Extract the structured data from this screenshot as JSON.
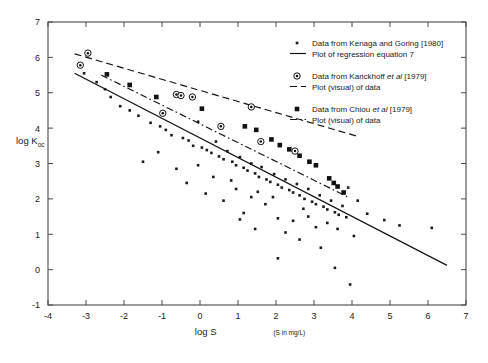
{
  "chart_data": {
    "type": "scatter",
    "title": "",
    "xlabel": "log S",
    "xlabel_units": "(S in mg/L)",
    "ylabel": "log K",
    "ylabel_subscript": "oc",
    "xlim": [
      -4,
      7
    ],
    "ylim": [
      -1,
      7
    ],
    "xticks": [
      -4,
      -3,
      -2,
      -1,
      0,
      1,
      2,
      3,
      4,
      5,
      6,
      7
    ],
    "yticks": [
      -1,
      0,
      1,
      2,
      3,
      4,
      5,
      6,
      7
    ],
    "grid": false,
    "legend_position": "upper-right",
    "series": [
      {
        "name": "kenaga-goring",
        "marker": "small-dot",
        "line": "solid",
        "legend_marker_label": "Data from Kenaga and Goring [1980]",
        "legend_line_label": "Plot of regression equation 7",
        "legend_italic_part": "",
        "line_endpoints": [
          [
            -3.3,
            5.55
          ],
          [
            6.5,
            0.12
          ]
        ],
        "points": [
          [
            -3.05,
            5.55
          ],
          [
            -2.72,
            5.3
          ],
          [
            -2.5,
            5.1
          ],
          [
            -2.35,
            4.88
          ],
          [
            -2.1,
            4.62
          ],
          [
            -1.85,
            4.5
          ],
          [
            -1.62,
            4.35
          ],
          [
            -1.5,
            3.05
          ],
          [
            -1.3,
            4.15
          ],
          [
            -1.05,
            4.05
          ],
          [
            -0.9,
            3.95
          ],
          [
            -0.75,
            3.8
          ],
          [
            -0.62,
            2.85
          ],
          [
            -0.45,
            3.72
          ],
          [
            -0.3,
            3.65
          ],
          [
            -0.18,
            3.5
          ],
          [
            -0.05,
            4.18
          ],
          [
            0.05,
            3.45
          ],
          [
            0.18,
            3.38
          ],
          [
            0.3,
            3.3
          ],
          [
            0.42,
            3.62
          ],
          [
            0.5,
            3.2
          ],
          [
            0.62,
            3.12
          ],
          [
            0.72,
            3.35
          ],
          [
            0.85,
            3.05
          ],
          [
            0.95,
            2.95
          ],
          [
            1.05,
            3.18
          ],
          [
            1.15,
            2.88
          ],
          [
            1.25,
            2.8
          ],
          [
            1.35,
            3.0
          ],
          [
            1.45,
            2.72
          ],
          [
            1.55,
            2.62
          ],
          [
            1.62,
            2.9
          ],
          [
            1.75,
            2.55
          ],
          [
            1.85,
            2.48
          ],
          [
            1.95,
            2.7
          ],
          [
            2.05,
            2.4
          ],
          [
            2.15,
            2.32
          ],
          [
            2.25,
            2.55
          ],
          [
            2.35,
            2.25
          ],
          [
            2.45,
            2.18
          ],
          [
            2.55,
            2.42
          ],
          [
            2.62,
            2.1
          ],
          [
            2.75,
            2.0
          ],
          [
            2.85,
            2.28
          ],
          [
            2.95,
            1.92
          ],
          [
            3.05,
            1.85
          ],
          [
            3.15,
            2.1
          ],
          [
            3.25,
            1.78
          ],
          [
            3.35,
            1.7
          ],
          [
            3.45,
            1.95
          ],
          [
            3.55,
            1.62
          ],
          [
            3.65,
            1.55
          ],
          [
            3.75,
            1.8
          ],
          [
            3.85,
            1.48
          ],
          [
            0.15,
            2.15
          ],
          [
            0.62,
            1.95
          ],
          [
            0.95,
            2.28
          ],
          [
            1.35,
            2.05
          ],
          [
            1.72,
            1.85
          ],
          [
            1.15,
            1.6
          ],
          [
            2.05,
            1.45
          ],
          [
            2.45,
            1.38
          ],
          [
            2.25,
            1.05
          ],
          [
            2.85,
            1.5
          ],
          [
            3.05,
            1.2
          ],
          [
            3.35,
            1.32
          ],
          [
            3.62,
            1.15
          ],
          [
            3.9,
            2.32
          ],
          [
            4.15,
            1.95
          ],
          [
            4.4,
            1.58
          ],
          [
            4.85,
            1.4
          ],
          [
            5.25,
            1.25
          ],
          [
            6.1,
            1.18
          ],
          [
            2.05,
            0.32
          ],
          [
            3.55,
            0.05
          ],
          [
            3.95,
            -0.42
          ],
          [
            -0.35,
            2.45
          ],
          [
            0.35,
            2.62
          ],
          [
            1.52,
            2.2
          ],
          [
            2.62,
            0.85
          ],
          [
            1.05,
            1.42
          ],
          [
            -1.1,
            3.32
          ],
          [
            -0.05,
            2.95
          ],
          [
            0.82,
            2.52
          ],
          [
            1.92,
            2.05
          ],
          [
            2.72,
            1.72
          ],
          [
            3.18,
            0.62
          ],
          [
            4.05,
            0.95
          ],
          [
            1.45,
            1.15
          ]
        ]
      },
      {
        "name": "karickhoff",
        "marker": "circle-dot",
        "line": "dashed",
        "legend_marker_label": "Data from Karickhoff",
        "legend_marker_label_italic": "et al",
        "legend_marker_label_tail": "[1979]",
        "legend_line_label": "Plot (visual) of data",
        "line_endpoints": [
          [
            -3.3,
            6.1
          ],
          [
            4.2,
            3.75
          ]
        ],
        "points": [
          [
            -2.95,
            6.12
          ],
          [
            -3.15,
            5.78
          ],
          [
            -0.62,
            4.95
          ],
          [
            -0.5,
            4.92
          ],
          [
            -0.2,
            4.88
          ],
          [
            -0.98,
            4.42
          ],
          [
            1.35,
            4.6
          ],
          [
            1.6,
            3.62
          ],
          [
            2.5,
            3.35
          ],
          [
            0.55,
            4.05
          ]
        ]
      },
      {
        "name": "chiou",
        "marker": "filled-square",
        "line": "dash-dot",
        "legend_marker_label": "Data from Chiou",
        "legend_marker_label_italic": "et al",
        "legend_marker_label_tail": "[1979]",
        "legend_line_label": "Plot (visual) of data",
        "line_endpoints": [
          [
            -2.6,
            5.5
          ],
          [
            3.9,
            2.05
          ]
        ],
        "points": [
          [
            -2.45,
            5.52
          ],
          [
            -1.85,
            5.22
          ],
          [
            -1.15,
            4.88
          ],
          [
            0.05,
            4.55
          ],
          [
            1.18,
            4.05
          ],
          [
            1.48,
            3.95
          ],
          [
            2.1,
            3.52
          ],
          [
            2.62,
            3.22
          ],
          [
            3.05,
            2.95
          ],
          [
            3.4,
            2.58
          ],
          [
            3.62,
            2.35
          ],
          [
            3.78,
            2.18
          ],
          [
            1.88,
            3.68
          ],
          [
            2.35,
            3.4
          ],
          [
            2.88,
            3.05
          ],
          [
            3.52,
            2.45
          ]
        ]
      }
    ]
  },
  "legend": {
    "entries": [
      {
        "marker_text": "Data from Kenaga and Goring [1980]",
        "line_text": "Plot of regression equation 7"
      },
      {
        "marker_text_pre": "Data from Karickhoff ",
        "marker_text_italic": "et al",
        "marker_text_post": " [1979]",
        "line_text": "Plot (visual) of data"
      },
      {
        "marker_text_pre": "Data from Chiou ",
        "marker_text_italic": "et al",
        "marker_text_post": " [1979]",
        "line_text": "Plot (visual) of data"
      }
    ]
  },
  "axes": {
    "y_label_main": "log K",
    "y_label_sub": "oc",
    "x_label_main": "log S",
    "x_label_units": "(S in mg/L)",
    "x_tick_labels": [
      "-4",
      "-3",
      "-2",
      "-1",
      "0",
      "1",
      "2",
      "3",
      "4",
      "5",
      "6",
      "7"
    ],
    "y_tick_labels": [
      "-1",
      "0",
      "1",
      "2",
      "3",
      "4",
      "5",
      "6",
      "7"
    ]
  },
  "colors": {
    "ink": "#111111",
    "axis": "#4a4a4a",
    "background": "#ffffff"
  }
}
